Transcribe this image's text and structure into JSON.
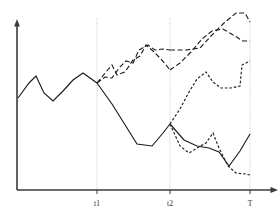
{
  "chart_data": {
    "type": "line",
    "title": "",
    "subtitle": "",
    "xlabel": "",
    "ylabel": "",
    "xlim": [
      0,
      279
    ],
    "ylim": [
      219,
      0
    ],
    "grid": true,
    "legend": false,
    "legend_position": "none",
    "axis": {
      "origin_x": 17,
      "origin_y": 190,
      "x_axis_end": 277,
      "y_axis_top": 22,
      "arrow_x": true,
      "arrow_y": true
    },
    "x_tick_labels": [
      "t1",
      "t2",
      "T"
    ],
    "x_tick_positions": [
      97,
      170,
      250
    ],
    "gridline_positions": [
      97,
      170,
      250
    ],
    "annotations": [],
    "series": [
      {
        "name": "history",
        "style": "solid",
        "dash": "none",
        "points": [
          [
            18,
            98
          ],
          [
            29,
            83
          ],
          [
            36,
            76
          ],
          [
            44,
            93
          ],
          [
            53,
            101
          ],
          [
            63,
            91
          ],
          [
            73,
            80
          ],
          [
            83,
            73
          ],
          [
            97,
            83
          ]
        ]
      },
      {
        "name": "baseline-path",
        "style": "solid",
        "dash": "none",
        "points": [
          [
            97,
            83
          ],
          [
            112,
            104
          ],
          [
            127,
            128
          ],
          [
            137,
            144
          ],
          [
            152,
            146
          ],
          [
            163,
            133
          ],
          [
            170,
            124
          ]
        ]
      },
      {
        "name": "baseline-continuation",
        "style": "solid",
        "dash": "none",
        "points": [
          [
            170,
            124
          ],
          [
            184,
            140
          ],
          [
            197,
            146
          ],
          [
            209,
            148
          ],
          [
            219,
            152
          ],
          [
            229,
            166
          ],
          [
            240,
            151
          ],
          [
            250,
            134
          ]
        ]
      },
      {
        "name": "upper-scenario-a",
        "style": "dashed",
        "dash": "long",
        "points": [
          [
            97,
            83
          ],
          [
            106,
            72
          ],
          [
            112,
            65
          ],
          [
            117,
            75
          ],
          [
            125,
            72
          ],
          [
            133,
            60
          ],
          [
            140,
            56
          ],
          [
            146,
            45
          ],
          [
            153,
            51
          ],
          [
            160,
            58
          ],
          [
            166,
            65
          ],
          [
            170,
            70
          ]
        ]
      },
      {
        "name": "upper-scenario-b",
        "style": "dashed",
        "dash": "long",
        "points": [
          [
            97,
            83
          ],
          [
            105,
            77
          ],
          [
            112,
            78
          ],
          [
            119,
            68
          ],
          [
            126,
            61
          ],
          [
            133,
            63
          ],
          [
            139,
            50
          ],
          [
            148,
            45
          ],
          [
            155,
            50
          ],
          [
            163,
            49
          ],
          [
            170,
            50
          ]
        ]
      },
      {
        "name": "upper-scenario-b-cont",
        "style": "dashed",
        "dash": "long",
        "points": [
          [
            170,
            50
          ],
          [
            186,
            50
          ],
          [
            200,
            48
          ],
          [
            211,
            36
          ],
          [
            224,
            23
          ],
          [
            236,
            13
          ],
          [
            245,
            13
          ],
          [
            250,
            22
          ]
        ]
      },
      {
        "name": "upper-scenario-a-cont",
        "style": "dashed",
        "dash": "long",
        "points": [
          [
            170,
            70
          ],
          [
            180,
            63
          ],
          [
            191,
            52
          ],
          [
            202,
            39
          ],
          [
            212,
            31
          ],
          [
            223,
            29
          ],
          [
            235,
            36
          ],
          [
            243,
            41
          ],
          [
            250,
            41
          ]
        ]
      },
      {
        "name": "mid-scenario",
        "style": "dashed",
        "dash": "short",
        "points": [
          [
            170,
            124
          ],
          [
            180,
            109
          ],
          [
            189,
            92
          ],
          [
            197,
            79
          ],
          [
            206,
            72
          ],
          [
            213,
            82
          ],
          [
            221,
            88
          ],
          [
            231,
            88
          ],
          [
            240,
            86
          ],
          [
            242,
            65
          ],
          [
            250,
            61
          ]
        ]
      },
      {
        "name": "lower-scenario",
        "style": "dashed",
        "dash": "short",
        "points": [
          [
            170,
            124
          ],
          [
            180,
            146
          ],
          [
            189,
            153
          ],
          [
            197,
            148
          ],
          [
            206,
            143
          ],
          [
            213,
            133
          ],
          [
            219,
            148
          ],
          [
            228,
            166
          ],
          [
            236,
            173
          ],
          [
            245,
            174
          ],
          [
            250,
            175
          ]
        ]
      }
    ]
  },
  "labels": {
    "t1": "t1",
    "t2": "t2",
    "T": "T"
  },
  "colors": {
    "line": "#1c1c1c",
    "axis": "#3a3a3a",
    "gridline": "#b8b8b8",
    "background": "#ffffff",
    "label": "#2a2a2a"
  }
}
